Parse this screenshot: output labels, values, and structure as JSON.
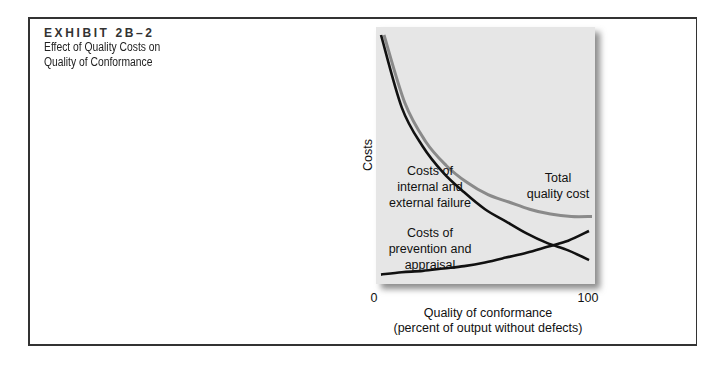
{
  "exhibit": {
    "number": "EXHIBIT 2B–2",
    "title_line1": "Effect of Quality Costs on",
    "title_line2": "Quality of Conformance"
  },
  "chart_data": {
    "type": "line",
    "title": "Effect of Quality Costs on Quality of Conformance",
    "xlabel": "Quality of conformance",
    "xlabel_sub": "(percent of output without defects)",
    "ylabel": "Costs",
    "x_ticks": [
      "0",
      "100"
    ],
    "xlim": [
      0,
      100
    ],
    "ylim": [
      0,
      100
    ],
    "grid": false,
    "legend": "inline labels",
    "x": [
      0,
      10,
      20,
      30,
      40,
      50,
      60,
      70,
      80,
      90,
      100
    ],
    "series": [
      {
        "name": "Costs of internal and external failure",
        "label_lines": [
          "Costs of",
          "internal and",
          "external failure"
        ],
        "color": "#111111",
        "values": [
          100,
          70,
          54,
          43,
          35,
          28,
          23,
          18,
          14,
          11,
          7
        ]
      },
      {
        "name": "Costs of prevention and appraisal",
        "label_lines": [
          "Costs of",
          "prevention and",
          "appraisal"
        ],
        "color": "#111111",
        "values": [
          1,
          2,
          2.5,
          3.5,
          4.5,
          6,
          8,
          10,
          12.5,
          15,
          19
        ]
      },
      {
        "name": "Total quality cost",
        "label_lines": [
          "Total",
          "quality cost"
        ],
        "color": "#8a8a8a",
        "values": [
          100,
          72,
          56,
          46,
          39,
          34,
          31,
          28,
          26,
          25,
          25
        ]
      }
    ],
    "panel_color": "#e6e6e6"
  }
}
